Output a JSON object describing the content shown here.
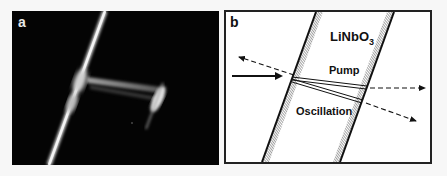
{
  "figure": {
    "panel_a": {
      "label": "a",
      "description": "photograph of crystal with pump and oscillation beams"
    },
    "panel_b": {
      "label": "b",
      "crystal_label": "LiNbO",
      "crystal_subscript": "3",
      "pump_label": "Pump",
      "oscillation_label": "Oscillation"
    }
  },
  "colors": {
    "photo_background": "#040404",
    "diagram_background": "#ffffff",
    "line": "#111111"
  }
}
